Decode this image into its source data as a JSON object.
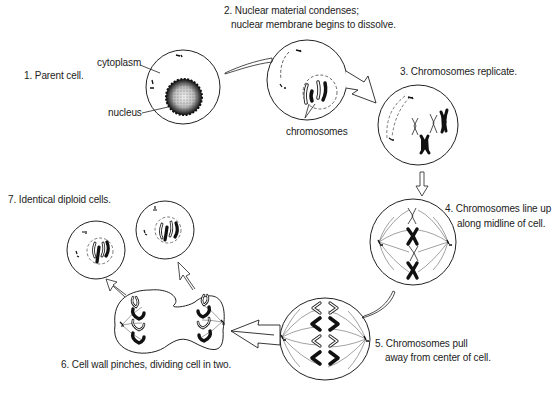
{
  "diagram": {
    "type": "cell-division-mitosis-cycle",
    "stages": [
      {
        "id": 1,
        "label": "1. Parent cell.",
        "lines": [
          "1. Parent cell."
        ]
      },
      {
        "id": 2,
        "label": "2. Nuclear material condenses; nuclear membrane begins to dissolve.",
        "lines": [
          "2. Nuclear material condenses;",
          "nuclear membrane begins to dissolve."
        ]
      },
      {
        "id": 3,
        "label": "3. Chromosomes replicate.",
        "lines": [
          "3. Chromosomes replicate."
        ]
      },
      {
        "id": 4,
        "label": "4. Chromosomes line up along midline of cell.",
        "lines": [
          "4. Chromosomes line up",
          "along midline of cell."
        ]
      },
      {
        "id": 5,
        "label": "5. Chromosomes pull away from center of cell.",
        "lines": [
          "5. Chromosomes pull",
          "away from center of cell."
        ]
      },
      {
        "id": 6,
        "label": "6. Cell wall pinches, dividing cell in two.",
        "lines": [
          "6. Cell wall pinches, dividing cell in two."
        ]
      },
      {
        "id": 7,
        "label": "7. Identical diploid cells.",
        "lines": [
          "7. Identical diploid cells."
        ]
      }
    ],
    "callouts": {
      "cytoplasm": "cytoplasm",
      "nucleus": "nucleus",
      "chromosomes": "chromosomes"
    },
    "flow": [
      "1 → 2",
      "2 → 3",
      "3 → 4",
      "4 → 5",
      "5 → 6",
      "6 → 7"
    ],
    "colors": {
      "line": "#222222",
      "background": "#ffffff",
      "fill_dark": "#111111"
    }
  }
}
